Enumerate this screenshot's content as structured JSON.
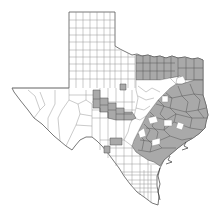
{
  "map": {
    "region": "Texas",
    "subdivision": "counties",
    "legend": [],
    "colors": {
      "shaded": "#a9a9a9",
      "unshaded": "#ffffff",
      "county_border": "#8a8a8a",
      "shaded_border": "#4f4f4f",
      "state_outline": "#555555"
    },
    "shaded_regions": [
      {
        "name": "north-central-band",
        "description": "Block of counties along Red River in north-east Texas"
      },
      {
        "name": "east-texas",
        "description": "Nearly all counties of east and south-east Texas to the Gulf coast"
      },
      {
        "name": "edwards-plateau-band",
        "description": "Diagonal band of counties in west-central Texas"
      },
      {
        "name": "south-west-counties",
        "description": "Scattered counties near the Rio Grande"
      }
    ]
  }
}
